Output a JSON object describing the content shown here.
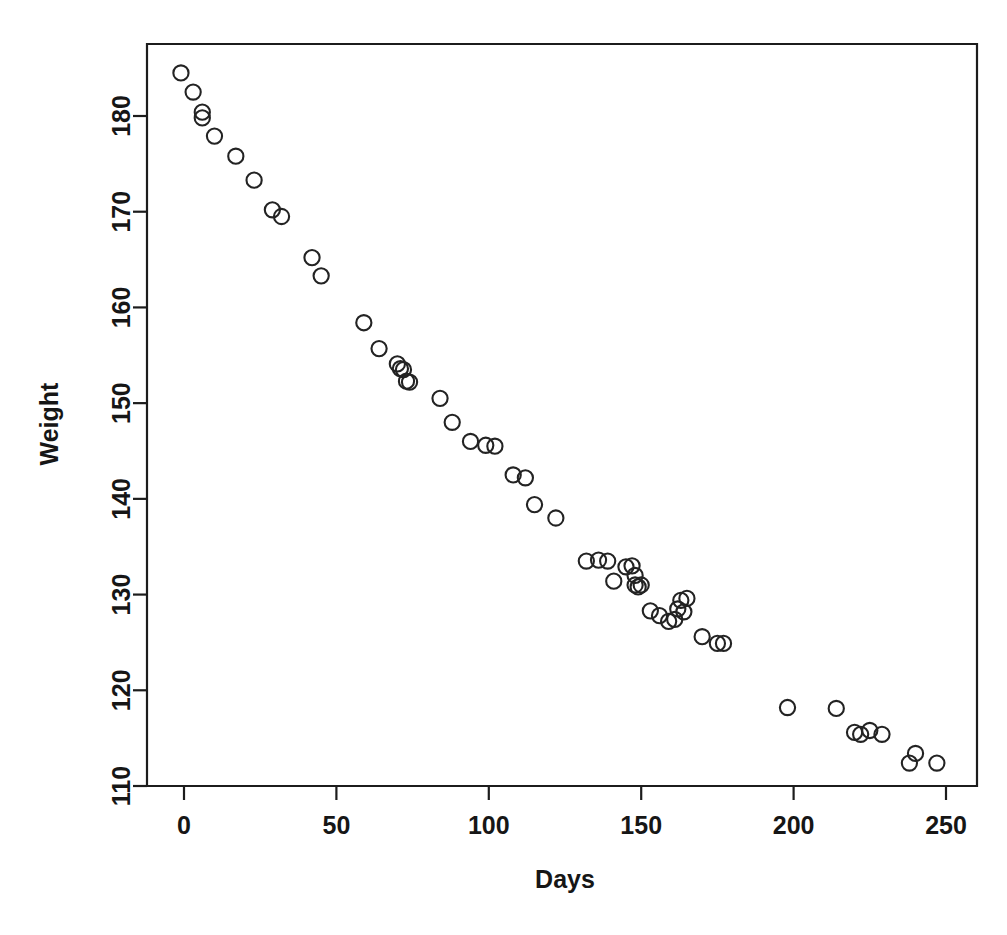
{
  "chart_data": {
    "type": "scatter",
    "title": "",
    "xlabel": "Days",
    "ylabel": "Weight",
    "xlim": [
      -8,
      250
    ],
    "ylim": [
      110,
      186
    ],
    "grid": false,
    "legend": null,
    "marker": "open-circle",
    "marker_color": "#232323",
    "xticks": [
      0,
      50,
      100,
      150,
      200,
      250
    ],
    "xtick_labels": [
      "0",
      "50",
      "100",
      "150",
      "200",
      "250"
    ],
    "yticks": [
      110,
      120,
      130,
      140,
      150,
      160,
      170,
      180
    ],
    "ytick_labels": [
      "110",
      "120",
      "130",
      "140",
      "150",
      "160",
      "170",
      "180"
    ],
    "x": [
      -1,
      3,
      6,
      6,
      10,
      17,
      23,
      29,
      32,
      42,
      45,
      59,
      64,
      70,
      71,
      72,
      73,
      74,
      84,
      88,
      94,
      99,
      102,
      108,
      112,
      115,
      122,
      132,
      136,
      139,
      141,
      145,
      147,
      148,
      148,
      149,
      150,
      153,
      156,
      159,
      161,
      162,
      163,
      164,
      165,
      170,
      175,
      177,
      198,
      214,
      220,
      222,
      225,
      229,
      238,
      240,
      247
    ],
    "y": [
      184.5,
      182.5,
      180.4,
      179.8,
      177.9,
      175.8,
      173.3,
      170.2,
      169.5,
      165.2,
      163.3,
      158.4,
      155.7,
      154.1,
      153.6,
      153.5,
      152.3,
      152.2,
      150.5,
      148.0,
      146.0,
      145.6,
      145.5,
      142.5,
      142.2,
      139.4,
      138.0,
      133.5,
      133.6,
      133.5,
      131.4,
      132.9,
      133.0,
      132.0,
      131.0,
      130.8,
      131.0,
      128.3,
      127.8,
      127.2,
      127.4,
      128.5,
      129.4,
      128.2,
      129.6,
      125.6,
      124.9,
      124.9,
      118.2,
      118.1,
      115.6,
      115.4,
      115.8,
      115.4,
      112.4,
      113.4,
      112.4
    ],
    "points": [
      {
        "x": -1,
        "y": 184.5
      },
      {
        "x": 3,
        "y": 182.5
      },
      {
        "x": 6,
        "y": 180.4
      },
      {
        "x": 6,
        "y": 179.8
      },
      {
        "x": 10,
        "y": 177.9
      },
      {
        "x": 17,
        "y": 175.8
      },
      {
        "x": 23,
        "y": 173.3
      },
      {
        "x": 29,
        "y": 170.2
      },
      {
        "x": 32,
        "y": 169.5
      },
      {
        "x": 42,
        "y": 165.2
      },
      {
        "x": 45,
        "y": 163.3
      },
      {
        "x": 59,
        "y": 158.4
      },
      {
        "x": 64,
        "y": 155.7
      },
      {
        "x": 70,
        "y": 154.1
      },
      {
        "x": 71,
        "y": 153.6
      },
      {
        "x": 72,
        "y": 153.5
      },
      {
        "x": 73,
        "y": 152.3
      },
      {
        "x": 74,
        "y": 152.2
      },
      {
        "x": 84,
        "y": 150.5
      },
      {
        "x": 88,
        "y": 148.0
      },
      {
        "x": 94,
        "y": 146.0
      },
      {
        "x": 99,
        "y": 145.6
      },
      {
        "x": 102,
        "y": 145.5
      },
      {
        "x": 108,
        "y": 142.5
      },
      {
        "x": 112,
        "y": 142.2
      },
      {
        "x": 115,
        "y": 139.4
      },
      {
        "x": 122,
        "y": 138.0
      },
      {
        "x": 132,
        "y": 133.5
      },
      {
        "x": 136,
        "y": 133.6
      },
      {
        "x": 139,
        "y": 133.5
      },
      {
        "x": 141,
        "y": 131.4
      },
      {
        "x": 145,
        "y": 132.9
      },
      {
        "x": 147,
        "y": 133.0
      },
      {
        "x": 148,
        "y": 132.0
      },
      {
        "x": 148,
        "y": 131.0
      },
      {
        "x": 149,
        "y": 130.8
      },
      {
        "x": 150,
        "y": 131.0
      },
      {
        "x": 153,
        "y": 128.3
      },
      {
        "x": 156,
        "y": 127.8
      },
      {
        "x": 159,
        "y": 127.2
      },
      {
        "x": 161,
        "y": 127.4
      },
      {
        "x": 162,
        "y": 128.5
      },
      {
        "x": 163,
        "y": 129.4
      },
      {
        "x": 164,
        "y": 128.2
      },
      {
        "x": 165,
        "y": 129.6
      },
      {
        "x": 170,
        "y": 125.6
      },
      {
        "x": 175,
        "y": 124.9
      },
      {
        "x": 177,
        "y": 124.9
      },
      {
        "x": 198,
        "y": 118.2
      },
      {
        "x": 214,
        "y": 118.1
      },
      {
        "x": 220,
        "y": 115.6
      },
      {
        "x": 222,
        "y": 115.4
      },
      {
        "x": 225,
        "y": 115.8
      },
      {
        "x": 229,
        "y": 115.4
      },
      {
        "x": 238,
        "y": 112.4
      },
      {
        "x": 240,
        "y": 113.4
      },
      {
        "x": 247,
        "y": 112.4
      }
    ],
    "n_points": 57
  },
  "axes": {
    "x_title": "Days",
    "y_title": "Weight"
  },
  "colors": {
    "axis": "#1c1c1c",
    "marker": "#232323",
    "background": "#ffffff"
  }
}
